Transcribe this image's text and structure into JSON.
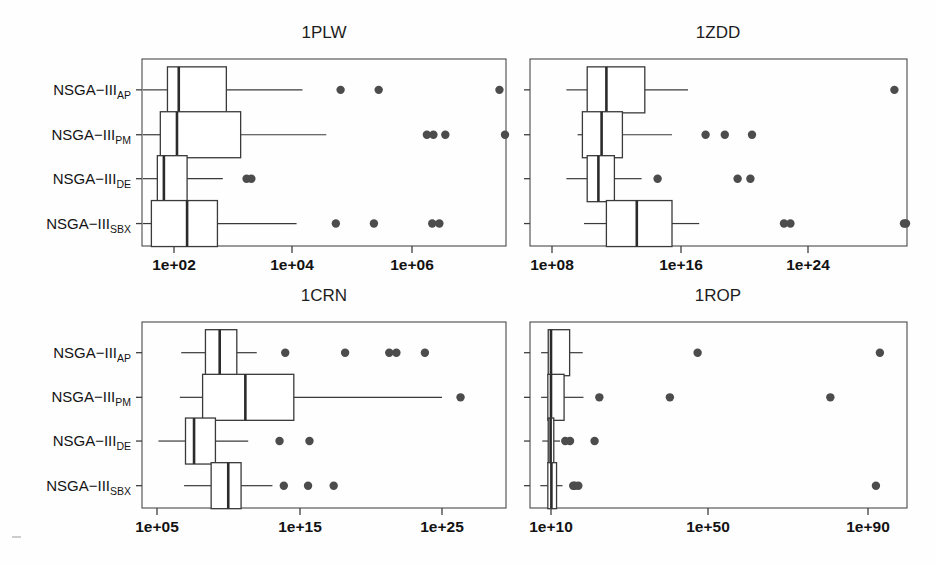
{
  "figure": {
    "width": 936,
    "height": 566,
    "background": "#fefefe",
    "box_fill": "#ffffff",
    "line_color": "#3a3a3a",
    "outlier_color": "#4c4c4c",
    "frame_color": "#4a4a4a"
  },
  "group_labels": [
    {
      "base": "NSGA−III",
      "sub": "AP"
    },
    {
      "base": "NSGA−III",
      "sub": "PM"
    },
    {
      "base": "NSGA−III",
      "sub": "DE"
    },
    {
      "base": "NSGA−III",
      "sub": "SBX"
    }
  ],
  "chart_data": {
    "type": "box",
    "title": "",
    "xlabel": "",
    "ylabel": "",
    "grid": false,
    "legend": "none",
    "x_scale": "log10",
    "shared_categories": [
      "NSGA-III_AP",
      "NSGA-III_PM",
      "NSGA-III_DE",
      "NSGA-III_SBX"
    ],
    "panels": [
      {
        "title": "1PLW",
        "row": 0,
        "col": 0,
        "xticks": [
          {
            "label": "1e+02",
            "exp": 2
          },
          {
            "label": "1e+04",
            "exp": 4
          },
          {
            "label": "1e+06",
            "exp": 6
          }
        ],
        "xlim_exp": [
          0.55,
          7.56
        ],
        "boxes": [
          {
            "category": "NSGA-III_AP",
            "whisker_lo": 1.14,
            "q1": 1.89,
            "median": 2.08,
            "q3": 2.88,
            "whisker_hi": 4.16,
            "outliers": [
              4.8,
              5.44,
              7.47
            ]
          },
          {
            "category": "NSGA-III_PM",
            "whisker_lo": 1.27,
            "q1": 1.77,
            "median": 2.05,
            "q3": 3.12,
            "whisker_hi": 4.56,
            "outliers": [
              6.25,
              6.36,
              6.56,
              7.74
            ]
          },
          {
            "category": "NSGA-III_DE",
            "whisker_lo": 1.04,
            "q1": 1.72,
            "median": 1.83,
            "q3": 2.22,
            "whisker_hi": 2.82,
            "outliers": [
              3.22,
              3.3
            ]
          },
          {
            "category": "NSGA-III_SBX",
            "whisker_lo": 1.06,
            "q1": 1.62,
            "median": 2.22,
            "q3": 2.73,
            "whisker_hi": 4.06,
            "outliers": [
              4.72,
              5.36,
              6.34,
              6.46
            ]
          }
        ]
      },
      {
        "title": "1ZDD",
        "row": 0,
        "col": 1,
        "xticks": [
          {
            "label": "1e+08",
            "exp": 8
          },
          {
            "label": "1e+16",
            "exp": 16
          },
          {
            "label": "1e+24",
            "exp": 24
          }
        ],
        "xlim_exp": [
          6.6,
          31.0
        ],
        "boxes": [
          {
            "category": "NSGA-III_AP",
            "whisker_lo": 8.9,
            "q1": 10.2,
            "median": 11.4,
            "q3": 13.8,
            "whisker_hi": 16.5,
            "outliers": [
              29.4
            ]
          },
          {
            "category": "NSGA-III_PM",
            "whisker_lo": 9.6,
            "q1": 9.9,
            "median": 11.1,
            "q3": 12.4,
            "whisker_hi": 15.5,
            "outliers": [
              17.6,
              18.8,
              20.5
            ]
          },
          {
            "category": "NSGA-III_DE",
            "whisker_lo": 8.9,
            "q1": 10.2,
            "median": 10.9,
            "q3": 11.9,
            "whisker_hi": 13.6,
            "outliers": [
              14.6,
              19.6,
              20.4
            ]
          },
          {
            "category": "NSGA-III_SBX",
            "whisker_lo": 10.0,
            "q1": 11.4,
            "median": 13.3,
            "q3": 15.5,
            "whisker_hi": 17.2,
            "outliers": [
              22.5,
              22.9,
              30.0,
              30.4
            ]
          }
        ]
      },
      {
        "title": "1CRN",
        "row": 1,
        "col": 0,
        "xticks": [
          {
            "label": "1e+05",
            "exp": 5
          },
          {
            "label": "1e+15",
            "exp": 15
          },
          {
            "label": "1e+25",
            "exp": 25
          }
        ],
        "xlim_exp": [
          3.9,
          30.4
        ],
        "boxes": [
          {
            "category": "NSGA-III_AP",
            "whisker_lo": 6.7,
            "q1": 8.4,
            "median": 9.4,
            "q3": 10.6,
            "whisker_hi": 12.0,
            "outliers": [
              14.0,
              18.2,
              21.3,
              21.8,
              23.8
            ]
          },
          {
            "category": "NSGA-III_PM",
            "whisker_lo": 6.6,
            "q1": 8.2,
            "median": 11.2,
            "q3": 14.6,
            "whisker_hi": 25.0,
            "outliers": [
              26.3
            ]
          },
          {
            "category": "NSGA-III_DE",
            "whisker_lo": 5.1,
            "q1": 7.0,
            "median": 7.6,
            "q3": 9.1,
            "whisker_hi": 11.4,
            "outliers": [
              13.6,
              15.7
            ]
          },
          {
            "category": "NSGA-III_SBX",
            "whisker_lo": 6.9,
            "q1": 8.8,
            "median": 10.0,
            "q3": 10.9,
            "whisker_hi": 13.1,
            "outliers": [
              13.9,
              15.6,
              17.4
            ]
          }
        ]
      },
      {
        "title": "1ROP",
        "row": 1,
        "col": 1,
        "xticks": [
          {
            "label": "1e+10",
            "exp": 10
          },
          {
            "label": "1e+50",
            "exp": 50
          },
          {
            "label": "1e+90",
            "exp": 90
          }
        ],
        "xlim_exp": [
          4.0,
          100.0
        ],
        "boxes": [
          {
            "category": "NSGA-III_AP",
            "whisker_lo": 7.5,
            "q1": 9.3,
            "median": 10.0,
            "q3": 14.7,
            "whisker_hi": 18.0,
            "outliers": [
              47.0,
              93.0
            ]
          },
          {
            "category": "NSGA-III_PM",
            "whisker_lo": 7.5,
            "q1": 9.2,
            "median": 10.0,
            "q3": 13.3,
            "whisker_hi": 18.2,
            "outliers": [
              22.2,
              40.0,
              80.5
            ]
          },
          {
            "category": "NSGA-III_DE",
            "whisker_lo": 7.8,
            "q1": 9.3,
            "median": 9.9,
            "q3": 10.7,
            "whisker_hi": 12.3,
            "outliers": [
              13.6,
              14.8,
              21.0
            ]
          },
          {
            "category": "NSGA-III_SBX",
            "whisker_lo": 7.3,
            "q1": 9.2,
            "median": 10.1,
            "q3": 11.4,
            "whisker_hi": 12.9,
            "outliers": [
              15.6,
              16.0,
              16.9,
              92.0
            ]
          }
        ]
      }
    ]
  },
  "geometry": {
    "panels": [
      {
        "x0": 142,
        "x1": 506,
        "y0": 59,
        "y1": 246,
        "title_x": 324,
        "title_y": 38,
        "tick_px": [
          174,
          292,
          412
        ],
        "label_y": 270,
        "show_ylabels": true
      },
      {
        "x0": 530,
        "x1": 907,
        "y0": 59,
        "y1": 246,
        "title_x": 718,
        "title_y": 38,
        "tick_px": [
          552,
          681,
          808
        ],
        "label_y": 270,
        "show_ylabels": false
      },
      {
        "x0": 142,
        "x1": 506,
        "y0": 322,
        "y1": 508,
        "title_x": 324,
        "title_y": 301,
        "tick_px": [
          157,
          300,
          442
        ],
        "label_y": 532,
        "show_ylabels": true
      },
      {
        "x0": 530,
        "x1": 907,
        "y0": 322,
        "y1": 508,
        "title_x": 718,
        "title_y": 301,
        "tick_px": [
          551,
          708,
          868
        ],
        "label_y": 532,
        "show_ylabels": false
      }
    ],
    "row_offsets": [
      0.165,
      0.405,
      0.64,
      0.88
    ],
    "box_half_height": 23,
    "outlier_radius": 4.2
  }
}
